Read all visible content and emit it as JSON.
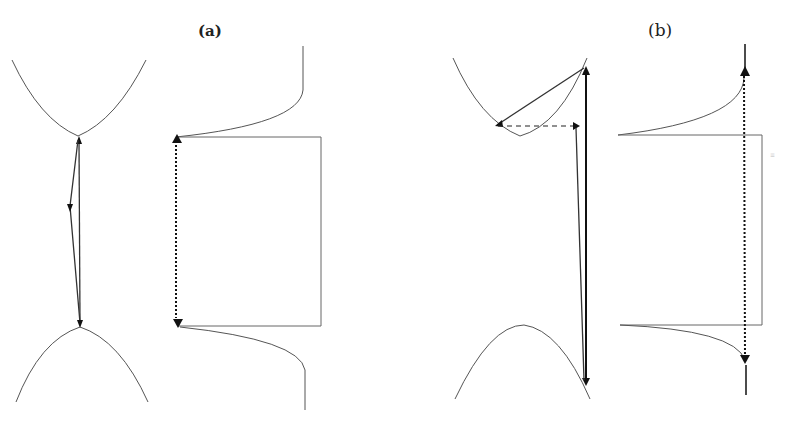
{
  "figure": {
    "panels": [
      {
        "id": "a",
        "label": "(a)"
      },
      {
        "id": "b",
        "label": "(b)"
      }
    ],
    "faint_mark": "≡"
  }
}
